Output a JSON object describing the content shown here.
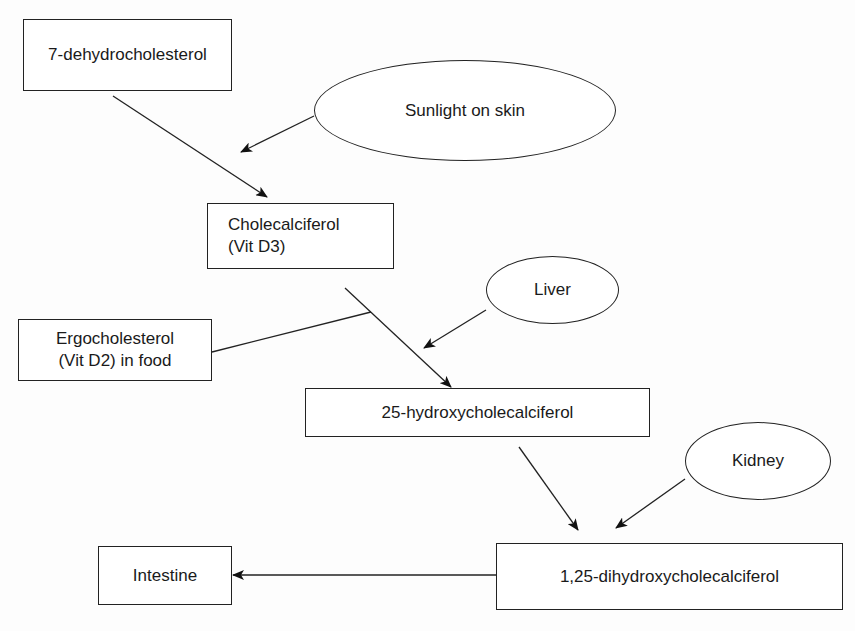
{
  "nodes": {
    "dehydrocholesterol": {
      "label": "7-dehydrocholesterol"
    },
    "sunlight": {
      "label": "Sunlight on skin"
    },
    "cholecalciferol": {
      "line1": "Cholecalciferol",
      "line2": "(Vit D3)"
    },
    "liver": {
      "label": "Liver"
    },
    "ergocholesterol": {
      "line1": "Ergocholesterol",
      "line2": "(Vit D2) in food"
    },
    "hydroxy": {
      "label": "25-hydroxycholecalciferol"
    },
    "kidney": {
      "label": "Kidney"
    },
    "dihydroxy": {
      "label": "1,25-dihydroxycholecalciferol"
    },
    "intestine": {
      "label": "Intestine"
    }
  },
  "edges": [
    {
      "from": "7-dehydrocholesterol",
      "to": "Cholecalciferol (Vit D3)"
    },
    {
      "from": "Sunlight on skin",
      "to": "7-dehydrocholesterol → Cholecalciferol conversion"
    },
    {
      "from": "Cholecalciferol (Vit D3)",
      "to": "25-hydroxycholecalciferol"
    },
    {
      "from": "Ergocholesterol (Vit D2) in food",
      "to": "Cholecalciferol → 25-hydroxycholecalciferol path"
    },
    {
      "from": "Liver",
      "to": "Cholecalciferol → 25-hydroxycholecalciferol conversion"
    },
    {
      "from": "25-hydroxycholecalciferol",
      "to": "1,25-dihydroxycholecalciferol"
    },
    {
      "from": "Kidney",
      "to": "25-hydroxy → 1,25-dihydroxy conversion"
    },
    {
      "from": "1,25-dihydroxycholecalciferol",
      "to": "Intestine"
    }
  ]
}
